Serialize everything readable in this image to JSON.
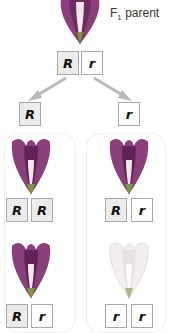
{
  "parent": {
    "label_prefix": "F",
    "label_sub": "1",
    "label_suffix": " parent",
    "flower_color": "purple",
    "genotype": [
      "R",
      "r"
    ]
  },
  "gametes": [
    {
      "allele": "R"
    },
    {
      "allele": "r"
    }
  ],
  "offspring": [
    {
      "genotype": [
        "R",
        "R"
      ],
      "flower_color": "purple"
    },
    {
      "genotype": [
        "R",
        "r"
      ],
      "flower_color": "purple"
    },
    {
      "genotype": [
        "R",
        "r"
      ],
      "flower_color": "purple"
    },
    {
      "genotype": [
        "r",
        "r"
      ],
      "flower_color": "white"
    }
  ],
  "colors": {
    "purple_petal": "#8a3f7a",
    "purple_dark": "#5e2453",
    "white_petal": "#f2eef0",
    "green_sepal": "#7a9a3a",
    "arrow": "#b8b8b8",
    "dominant_box": "#ececec",
    "recessive_box": "#ffffff"
  }
}
